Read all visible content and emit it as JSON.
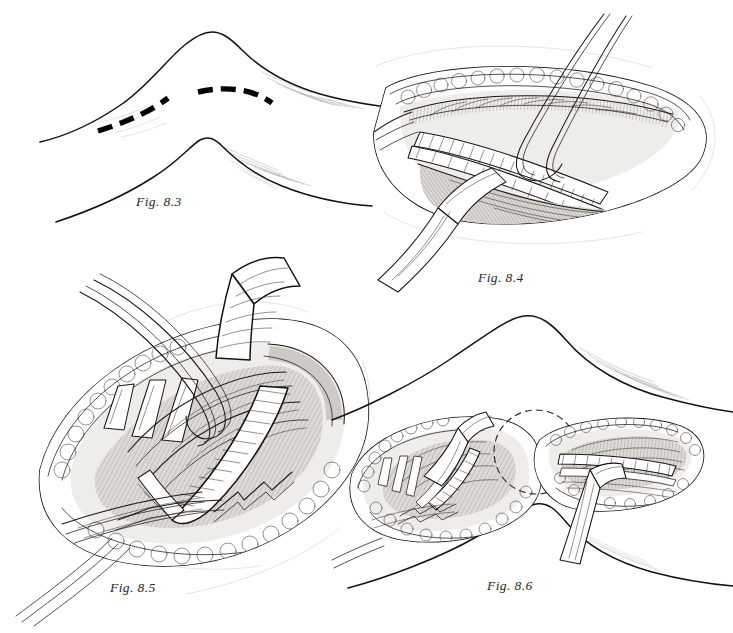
{
  "page": {
    "kind": "surgical-atlas-figure-plate",
    "background_color": "#ffffff",
    "ink_color": "#15120f",
    "caption_color": "#2a2724",
    "width": 733,
    "height": 633
  },
  "figures": [
    {
      "id": "fig-8-3",
      "caption": "Fig. 8.3",
      "quadrant": "top-left",
      "subject": "Leg in flexed position showing planned above-knee and below-knee medial skin incision lines",
      "elements": [
        "leg-contour-upper",
        "leg-contour-lower",
        "incision-line-above-knee",
        "incision-line-below-knee",
        "feathered-shading-strokes"
      ],
      "incision_lines": 2,
      "incision_style": "heavy-dashed",
      "incision_color": "#000000"
    },
    {
      "id": "fig-8-4",
      "caption": "Fig. 8.4",
      "quadrant": "top-right",
      "subject": "Above-knee medial exposure: popliteal artery isolated with two vessel loops, retractor in wound",
      "elements": [
        "wound-edge",
        "subcutaneous-fat-lobules",
        "muscle-belly",
        "ringed-vascular-structure",
        "vessel-loop-anterior",
        "vessel-loop-posterior",
        "retractor-blade"
      ],
      "vessel_loops": 2,
      "retractors": 1
    },
    {
      "id": "fig-8-5",
      "caption": "Fig. 8.5",
      "quadrant": "bottom-left",
      "subject": "Magnified above-knee exposure with retractor blade elevating sartorius, artery encircled by vessel loops",
      "elements": [
        "wound-edge",
        "subcutaneous-fat-lobules",
        "retractor-blade",
        "vessel-loop-anterior",
        "vessel-loop-posterior",
        "ringed-vascular-structure",
        "deep-muscle-tendon-bundles",
        "fascial-flap-edges"
      ],
      "vessel_loops": 2,
      "retractors": 1
    },
    {
      "id": "fig-8-6",
      "caption": "Fig. 8.6",
      "quadrant": "bottom-right",
      "subject": "Both above-knee and below-knee incisions open with dashed circle marking the subcutaneous tunnel route behind the knee",
      "elements": [
        "leg-contour",
        "above-knee-wound",
        "below-knee-wound",
        "tunnel-route-dashed-circle",
        "retractor-blade-upper",
        "retractor-blade-lower",
        "ringed-vascular-structure-upper",
        "ringed-vascular-structure-lower"
      ],
      "wounds": 2,
      "retractors": 2,
      "tunnel_marker_style": "dashed-circle"
    }
  ]
}
